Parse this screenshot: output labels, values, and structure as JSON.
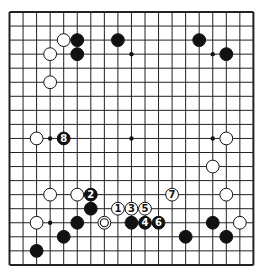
{
  "board": {
    "size": 19,
    "origin_x": 9.5,
    "origin_y": 12,
    "step_x": 13.55,
    "step_y": 14.05,
    "line_color": "#222222",
    "border_width": 2,
    "line_width": 1,
    "star_points": [
      [
        3,
        3
      ],
      [
        9,
        3
      ],
      [
        15,
        3
      ],
      [
        3,
        9
      ],
      [
        9,
        9
      ],
      [
        15,
        9
      ],
      [
        3,
        15
      ],
      [
        9,
        15
      ],
      [
        15,
        15
      ]
    ]
  },
  "stones": [
    {
      "color": "white",
      "c": 4,
      "r": 2
    },
    {
      "color": "black",
      "c": 5,
      "r": 2
    },
    {
      "color": "black",
      "c": 5,
      "r": 3
    },
    {
      "color": "black",
      "c": 8,
      "r": 2
    },
    {
      "color": "white",
      "c": 3,
      "r": 3
    },
    {
      "color": "white",
      "c": 3,
      "r": 5
    },
    {
      "color": "black",
      "c": 14,
      "r": 2
    },
    {
      "color": "black",
      "c": 16,
      "r": 3
    },
    {
      "color": "white",
      "c": 2,
      "r": 9
    },
    {
      "color": "black",
      "c": 4,
      "r": 9,
      "label": "8"
    },
    {
      "color": "white",
      "c": 16,
      "r": 9
    },
    {
      "color": "white",
      "c": 15,
      "r": 11
    },
    {
      "color": "white",
      "c": 3,
      "r": 13
    },
    {
      "color": "white",
      "c": 5,
      "r": 13
    },
    {
      "color": "black",
      "c": 6,
      "r": 13,
      "label": "2"
    },
    {
      "color": "white",
      "c": 12,
      "r": 13,
      "label": "7"
    },
    {
      "color": "white",
      "c": 16,
      "r": 13
    },
    {
      "color": "black",
      "c": 6,
      "r": 14
    },
    {
      "color": "white",
      "c": 8,
      "r": 14,
      "label": "1"
    },
    {
      "color": "white",
      "c": 9,
      "r": 14,
      "label": "3"
    },
    {
      "color": "white",
      "c": 10,
      "r": 14,
      "label": "5"
    },
    {
      "color": "white",
      "c": 2,
      "r": 15
    },
    {
      "color": "black",
      "c": 5,
      "r": 15
    },
    {
      "color": "white",
      "c": 7,
      "r": 15,
      "marked": true
    },
    {
      "color": "black",
      "c": 9,
      "r": 15
    },
    {
      "color": "black",
      "c": 10,
      "r": 15,
      "label": "4"
    },
    {
      "color": "black",
      "c": 11,
      "r": 15,
      "label": "6"
    },
    {
      "color": "black",
      "c": 15,
      "r": 15
    },
    {
      "color": "white",
      "c": 17,
      "r": 15
    },
    {
      "color": "black",
      "c": 4,
      "r": 16
    },
    {
      "color": "black",
      "c": 13,
      "r": 16
    },
    {
      "color": "black",
      "c": 16,
      "r": 16
    },
    {
      "color": "black",
      "c": 2,
      "r": 17
    }
  ]
}
